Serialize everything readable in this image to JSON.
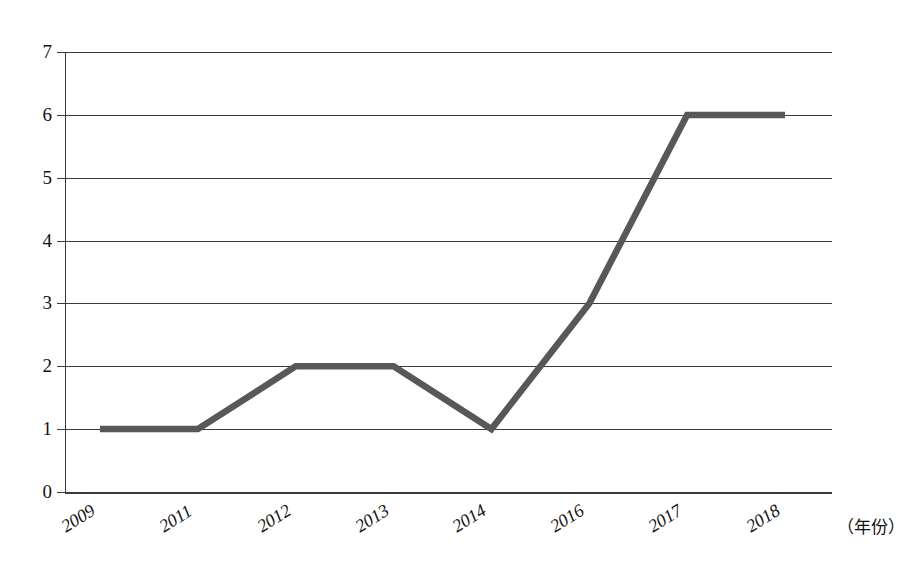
{
  "chart_data": {
    "type": "line",
    "title": "",
    "subtitle": "",
    "xlabel": "（年份）",
    "ylabel": "",
    "categories": [
      "2009",
      "2011",
      "2012",
      "2013",
      "2014",
      "2016",
      "2017",
      "2018"
    ],
    "values": [
      1,
      1,
      2,
      2,
      1,
      3,
      6,
      6
    ],
    "series": [
      {
        "name": "",
        "values": [
          1,
          1,
          2,
          2,
          1,
          3,
          6,
          6
        ]
      }
    ],
    "xlim": [
      0,
      7
    ],
    "ylim": [
      0,
      7
    ],
    "ytick_labels": [
      "0",
      "1",
      "2",
      "3",
      "4",
      "5",
      "6",
      "7"
    ],
    "ytick_values": [
      0,
      1,
      2,
      3,
      4,
      5,
      6,
      7
    ],
    "grid": "horizontal",
    "legend": "none",
    "line_color": "#585858",
    "axis_color": "#3a3a3a",
    "background": "#ffffff",
    "markers": "none",
    "annotations": []
  },
  "axes": {
    "y_labels": [
      {
        "text": "7",
        "value": 7
      },
      {
        "text": "6",
        "value": 6
      },
      {
        "text": "5",
        "value": 5
      },
      {
        "text": "4",
        "value": 4
      },
      {
        "text": "3",
        "value": 3
      },
      {
        "text": "2",
        "value": 2
      },
      {
        "text": "1",
        "value": 1
      },
      {
        "text": "0",
        "value": 0
      }
    ],
    "x_labels": [
      {
        "text": "2009"
      },
      {
        "text": "2011"
      },
      {
        "text": "2012"
      },
      {
        "text": "2013"
      },
      {
        "text": "2014"
      },
      {
        "text": "2016"
      },
      {
        "text": "2017"
      },
      {
        "text": "2018"
      }
    ],
    "x_unit": "（年份）"
  }
}
